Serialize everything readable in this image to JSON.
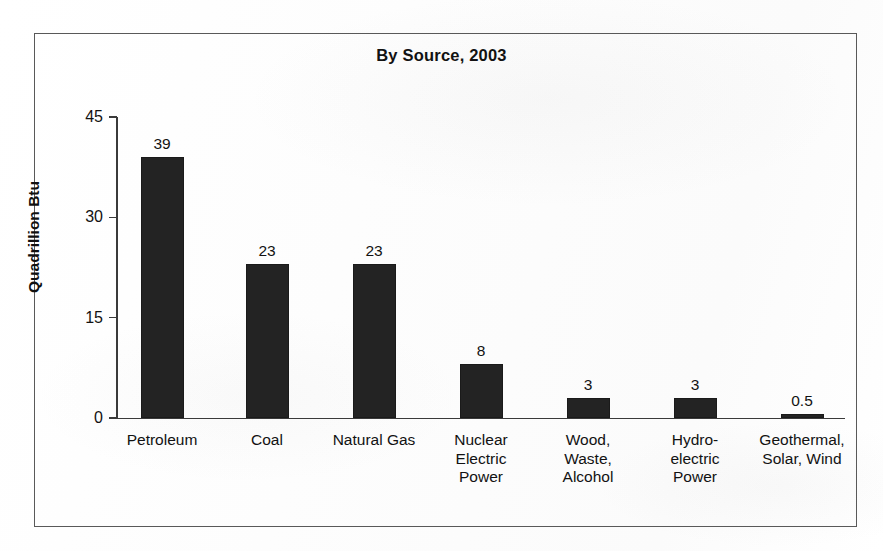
{
  "figure": {
    "title": "By Source, 2003",
    "frame_color": "#595959",
    "paper_color": "#fefefe",
    "bar_color": "#232323",
    "axis_color": "#3a3a3a"
  },
  "chart_data": {
    "type": "bar",
    "title": "By Source, 2003",
    "xlabel": "",
    "ylabel": "Quadrillion Btu",
    "ylim": [
      0,
      45
    ],
    "yticks": [
      0,
      15,
      30,
      45
    ],
    "ytick_labels": [
      "0",
      "15",
      "30",
      "45"
    ],
    "grid": false,
    "legend": null,
    "categories": [
      "Petroleum",
      "Coal",
      "Natural Gas",
      "Nuclear\nElectric\nPower",
      "Wood,\nWaste,\nAlcohol",
      "Hydro-\nelectric\nPower",
      "Geothermal,\nSolar, Wind"
    ],
    "values": [
      39,
      23,
      23,
      8,
      3,
      3,
      0.5
    ],
    "value_labels": [
      "39",
      "23",
      "23",
      "8",
      "3",
      "3",
      "0.5"
    ]
  }
}
